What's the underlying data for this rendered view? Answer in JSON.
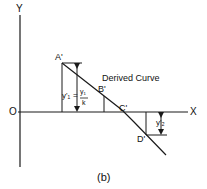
{
  "diagram": {
    "caption": "(b)",
    "axes": {
      "y_label": "Y",
      "x_label": "X",
      "origin_label": "O"
    },
    "curve_label": "Derived Curve",
    "points": [
      {
        "name": "A'",
        "label": "A'"
      },
      {
        "name": "B'",
        "label": "B'"
      },
      {
        "name": "C'",
        "label": "C'"
      },
      {
        "name": "D'",
        "label": "D'"
      }
    ],
    "annotations": {
      "y1_prime": "y'₁",
      "equals": "=",
      "fraction_numerator": "y₁",
      "fraction_denominator": "k",
      "y2_prime": "y'₂"
    },
    "colors": {
      "line": "#1a1a1a",
      "background": "#ffffff"
    }
  }
}
